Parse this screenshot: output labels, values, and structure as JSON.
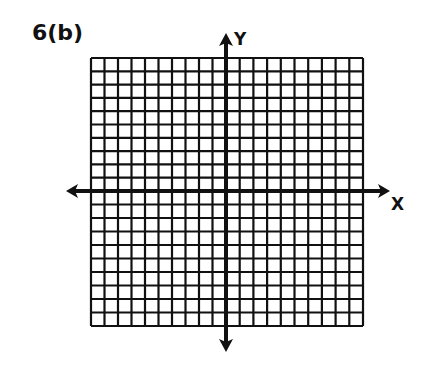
{
  "title": "6(b)",
  "axes": {
    "x_label": "X",
    "y_label": "Y"
  },
  "grid": {
    "columns": 20,
    "rows": 20,
    "left": 91,
    "right": 363,
    "top": 58,
    "bottom": 326,
    "x_axis_y": 191,
    "y_axis_x": 226,
    "line_color": "#111111"
  },
  "x_axis": {
    "start_x": 66,
    "end_x": 390,
    "arrows": "both"
  },
  "y_axis": {
    "start_y": 33,
    "end_y": 352,
    "arrows": "both"
  }
}
